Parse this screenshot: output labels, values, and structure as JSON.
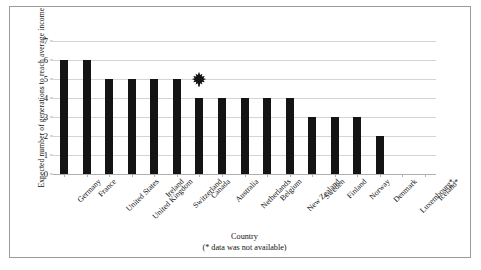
{
  "chart_data": {
    "type": "bar",
    "title": "",
    "xlabel": "Country",
    "xlabel_note": "(* data was not available)",
    "ylabel": "Expected number of generations to reach average income",
    "ylim": [
      0,
      7
    ],
    "yticks": [
      0,
      1,
      2,
      3,
      4,
      5,
      6,
      7
    ],
    "ytick_labels": [
      "0",
      "1",
      "2",
      "3",
      "4",
      "5",
      "6",
      "7"
    ],
    "grid": true,
    "legend": "none",
    "bar_color": "#141414",
    "gridline_color": "#d4d4d4",
    "categories": [
      "Germany",
      "France",
      "United States",
      "United Kingdom",
      "Ireland",
      "Switzerland",
      "Canada",
      "Australia",
      "Netherlands",
      "Belgium",
      "New Zealand",
      "Sweden",
      "Finland",
      "Norway",
      "Denmark",
      "Luxembourg*",
      "Iceland*"
    ],
    "values": [
      6,
      6,
      5,
      5,
      5,
      5,
      4,
      4,
      4,
      4,
      4,
      3,
      3,
      3,
      2,
      null,
      null
    ],
    "annotations": [
      {
        "name": "maple-leaf-marker",
        "icon": "maple-leaf-icon",
        "category": "Canada",
        "y": 5,
        "color": "#141414"
      }
    ]
  }
}
